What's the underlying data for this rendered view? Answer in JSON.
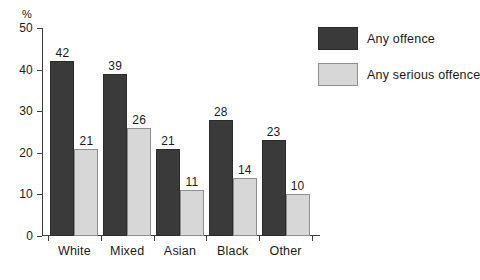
{
  "chart_data": {
    "type": "bar",
    "title": "",
    "xlabel": "",
    "ylabel": "%",
    "ylim": [
      0,
      50
    ],
    "yticks": [
      0,
      10,
      20,
      30,
      40,
      50
    ],
    "grid": false,
    "legend_position": "right",
    "categories": [
      "White",
      "Mixed",
      "Asian",
      "Black",
      "Other"
    ],
    "series": [
      {
        "name": "Any offence",
        "color": "#3a3a3a",
        "values": [
          42,
          39,
          21,
          28,
          23
        ]
      },
      {
        "name": "Any serious offence",
        "color": "#d7d7d7",
        "values": [
          21,
          26,
          11,
          14,
          10
        ]
      }
    ]
  }
}
